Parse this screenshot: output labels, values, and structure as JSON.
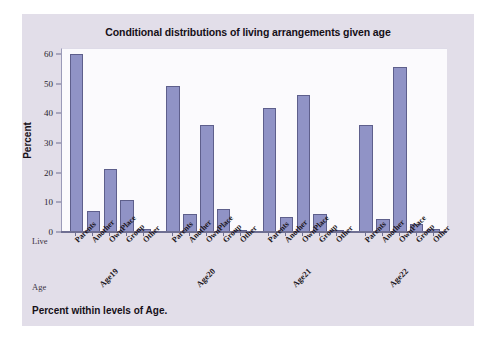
{
  "chart_data": {
    "type": "bar",
    "title": "Conditional distributions of living arrangements given age",
    "xlabel": "",
    "ylabel": "Percent",
    "ylim": [
      0,
      62
    ],
    "yticks": [
      0,
      10,
      20,
      30,
      40,
      50,
      60
    ],
    "grid": false,
    "legend": "none",
    "categories": [
      "Parents",
      "Another",
      "OwnPlace",
      "Group",
      "Other"
    ],
    "groups": [
      "Age19",
      "Age20",
      "Age21",
      "Age22"
    ],
    "group_axis_caption": "Age",
    "category_axis_caption": "Live",
    "bar_color": "#9093c6",
    "bar_border_color": "#5e5f8c",
    "panel_color": "#e2dee9",
    "plot_bg_color": "#fbfafd",
    "series": [
      {
        "name": "Age19",
        "values": [
          60.1,
          7.0,
          21.4,
          10.9,
          0.9
        ]
      },
      {
        "name": "Age20",
        "values": [
          49.2,
          6.2,
          36.1,
          7.8,
          0.4
        ]
      },
      {
        "name": "Age21",
        "values": [
          41.8,
          5.0,
          46.2,
          6.0,
          0.6
        ]
      },
      {
        "name": "Age22",
        "values": [
          36.0,
          4.3,
          55.5,
          2.7,
          0.9
        ]
      }
    ],
    "footnote": "Percent within levels of Age."
  },
  "footer": {
    "note": "Percent within levels of Age."
  }
}
